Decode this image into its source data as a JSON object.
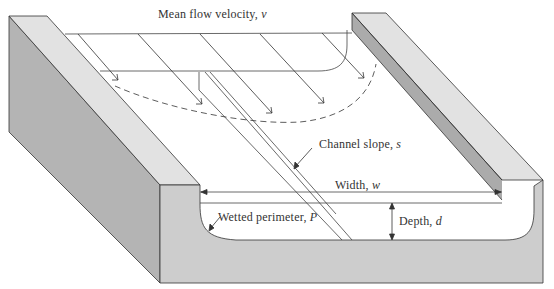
{
  "diagram": {
    "labels": {
      "velocity": {
        "text": "Mean flow velocity,",
        "symbol": "v"
      },
      "slope": {
        "text": "Channel slope,",
        "symbol": "s"
      },
      "width": {
        "text": "Width,",
        "symbol": "w"
      },
      "depth": {
        "text": "Depth,",
        "symbol": "d"
      },
      "perimeter": {
        "text": "Wetted perimeter,",
        "symbol": "P"
      }
    },
    "colors": {
      "bank_top": "#e4e4e4",
      "bank_side": "#b8b8b8",
      "bank_front": "#cfcfcf",
      "line": "#333333",
      "water": "#ffffff"
    }
  }
}
